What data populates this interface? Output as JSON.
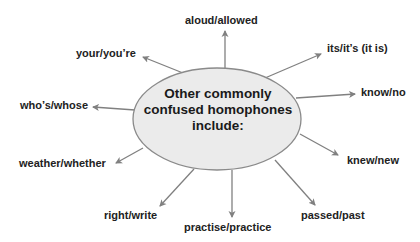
{
  "diagram": {
    "type": "spider-diagram",
    "center": {
      "lines": [
        "Other commonly",
        "confused homophones",
        "include:"
      ],
      "fill": "#ebebeb",
      "stroke": "#8a8a8a"
    },
    "arrow_color": "#808080",
    "branches": [
      {
        "label": "aloud/allowed"
      },
      {
        "label": "its/it’s (it is)"
      },
      {
        "label": "know/no"
      },
      {
        "label": "knew/new"
      },
      {
        "label": "passed/past"
      },
      {
        "label": "practise/practice"
      },
      {
        "label": "right/write"
      },
      {
        "label": "weather/whether"
      },
      {
        "label": "who’s/whose"
      },
      {
        "label": "your/you’re"
      }
    ]
  }
}
